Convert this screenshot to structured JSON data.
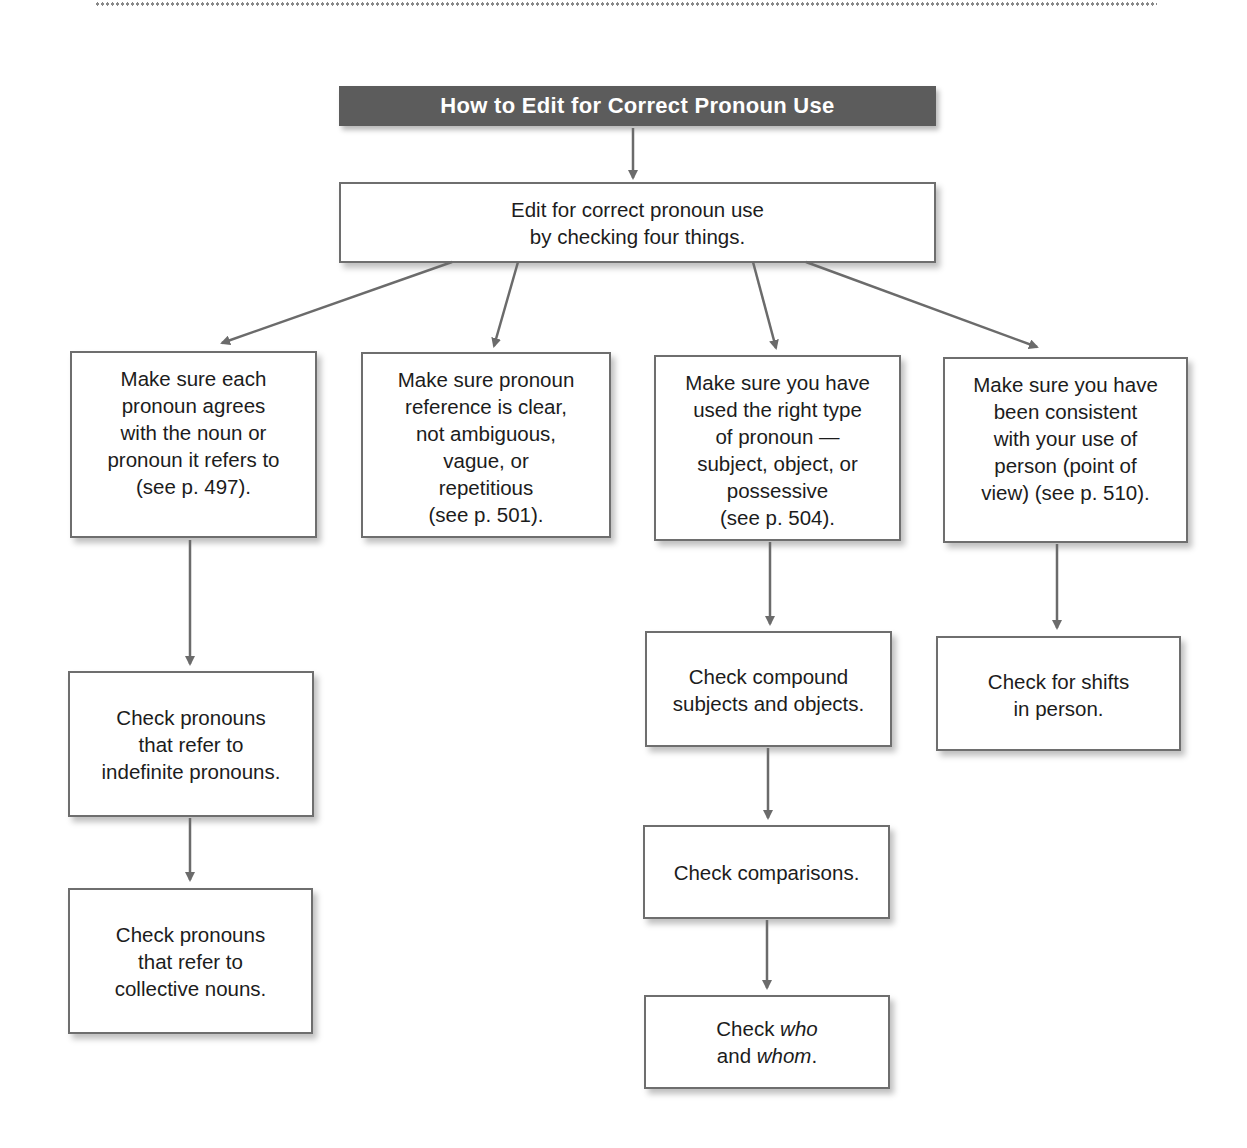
{
  "title": "How to Edit for Correct Pronoun Use",
  "root": {
    "text": "Edit for correct pronoun use\nby checking four things."
  },
  "branches": [
    {
      "text": "Make sure each\npronoun agrees\nwith the noun or\npronoun it refers to\n(see p. 497).",
      "children": [
        {
          "text": "Check pronouns\nthat refer to\nindefinite pronouns."
        },
        {
          "text": "Check pronouns\nthat refer to\ncollective nouns."
        }
      ]
    },
    {
      "text": "Make sure pronoun\nreference is clear,\nnot ambiguous,\nvague, or\nrepetitious\n(see p. 501).",
      "children": []
    },
    {
      "text": "Make sure you have\nused the right type\nof pronoun —\nsubject, object, or\npossessive\n(see p. 504).",
      "children": [
        {
          "text": "Check compound\nsubjects and objects."
        },
        {
          "text": "Check comparisons."
        },
        {
          "text_parts": [
            "Check ",
            "who",
            "\nand ",
            "whom",
            "."
          ]
        }
      ]
    },
    {
      "text": "Make sure you have\nbeen consistent\nwith your use of\nperson (point of\nview) (see p. 510).",
      "children": [
        {
          "text": "Check for shifts\nin person."
        }
      ]
    }
  ],
  "colors": {
    "title_bar": "#5c5c5c",
    "title_text": "#ffffff",
    "box_border": "#6e6e6e",
    "arrow": "#6b6b6b",
    "text": "#1c1c1c"
  }
}
